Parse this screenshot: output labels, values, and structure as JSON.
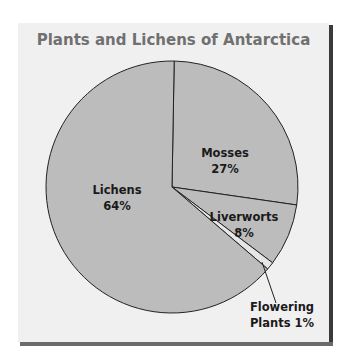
{
  "chart_data": {
    "type": "pie",
    "title": "Plants and Lichens of Antarctica",
    "categories": [
      "Mosses",
      "Liverworts",
      "Flowering Plants",
      "Lichens"
    ],
    "values": [
      27,
      8,
      1,
      64
    ],
    "unit": "%",
    "labels": [
      {
        "name": "Mosses",
        "value": "27%"
      },
      {
        "name": "Liverworts",
        "value": "8%"
      },
      {
        "name": "Flowering Plants",
        "value": "1%"
      },
      {
        "name": "Lichens",
        "value": "64%"
      }
    ],
    "colors": {
      "slice_fill": "#bcbcbc",
      "flowering_fill": "#e6e6e6",
      "outline": "#222222",
      "panel": "#f0f0f0",
      "title": "#707070"
    },
    "legend": "none",
    "grid": false
  },
  "title": "Plants and Lichens of Antarctica",
  "labels": {
    "mosses_name": "Mosses",
    "mosses_value": "27%",
    "liverworts_name": "Liverworts",
    "liverworts_value": "8%",
    "flowering_line1": "Flowering",
    "flowering_line2": "Plants 1%",
    "lichens_name": "Lichens",
    "lichens_value": "64%"
  }
}
